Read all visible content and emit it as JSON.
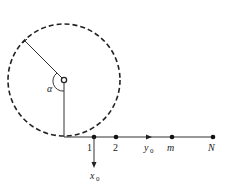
{
  "diagram": {
    "angle_label": "α",
    "nodes": [
      {
        "label": "1",
        "x": 94
      },
      {
        "label": "2",
        "x": 116
      },
      {
        "label": "m",
        "x": 172
      },
      {
        "label": "N",
        "x": 213
      }
    ],
    "axis_y_label": "y",
    "axis_y_sub": "0",
    "axis_x_label": "x",
    "axis_x_sub": "0",
    "colors": {
      "stroke": "#222222",
      "background": "#ffffff"
    }
  }
}
